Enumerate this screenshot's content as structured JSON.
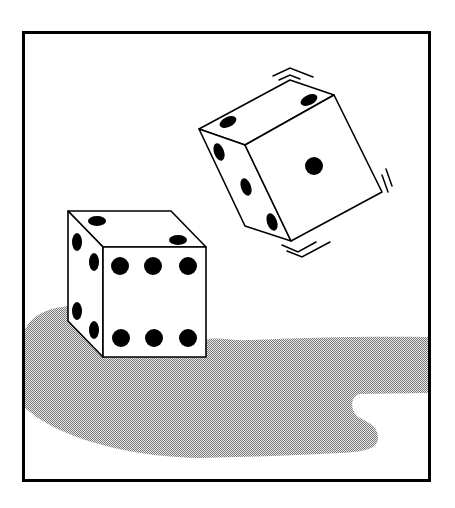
{
  "colors": {
    "background": "#ffffff",
    "ink": "#000000",
    "die_face": "#ffffff",
    "shadow_dark": "#8a8a8a",
    "shadow_light": "#e6e6e6"
  },
  "frame": {
    "x": 22,
    "y": 31,
    "width": 409,
    "height": 451,
    "stroke_width": 3
  },
  "dice": [
    {
      "name": "resting-die",
      "visible_faces": {
        "top": 2,
        "left": 4,
        "front": 6
      }
    },
    {
      "name": "tumbling-die",
      "visible_faces": {
        "top": 2,
        "left": 3,
        "front": 1
      },
      "motion_lines": 3
    }
  ],
  "shadow": {
    "pattern": "dither-checker"
  }
}
